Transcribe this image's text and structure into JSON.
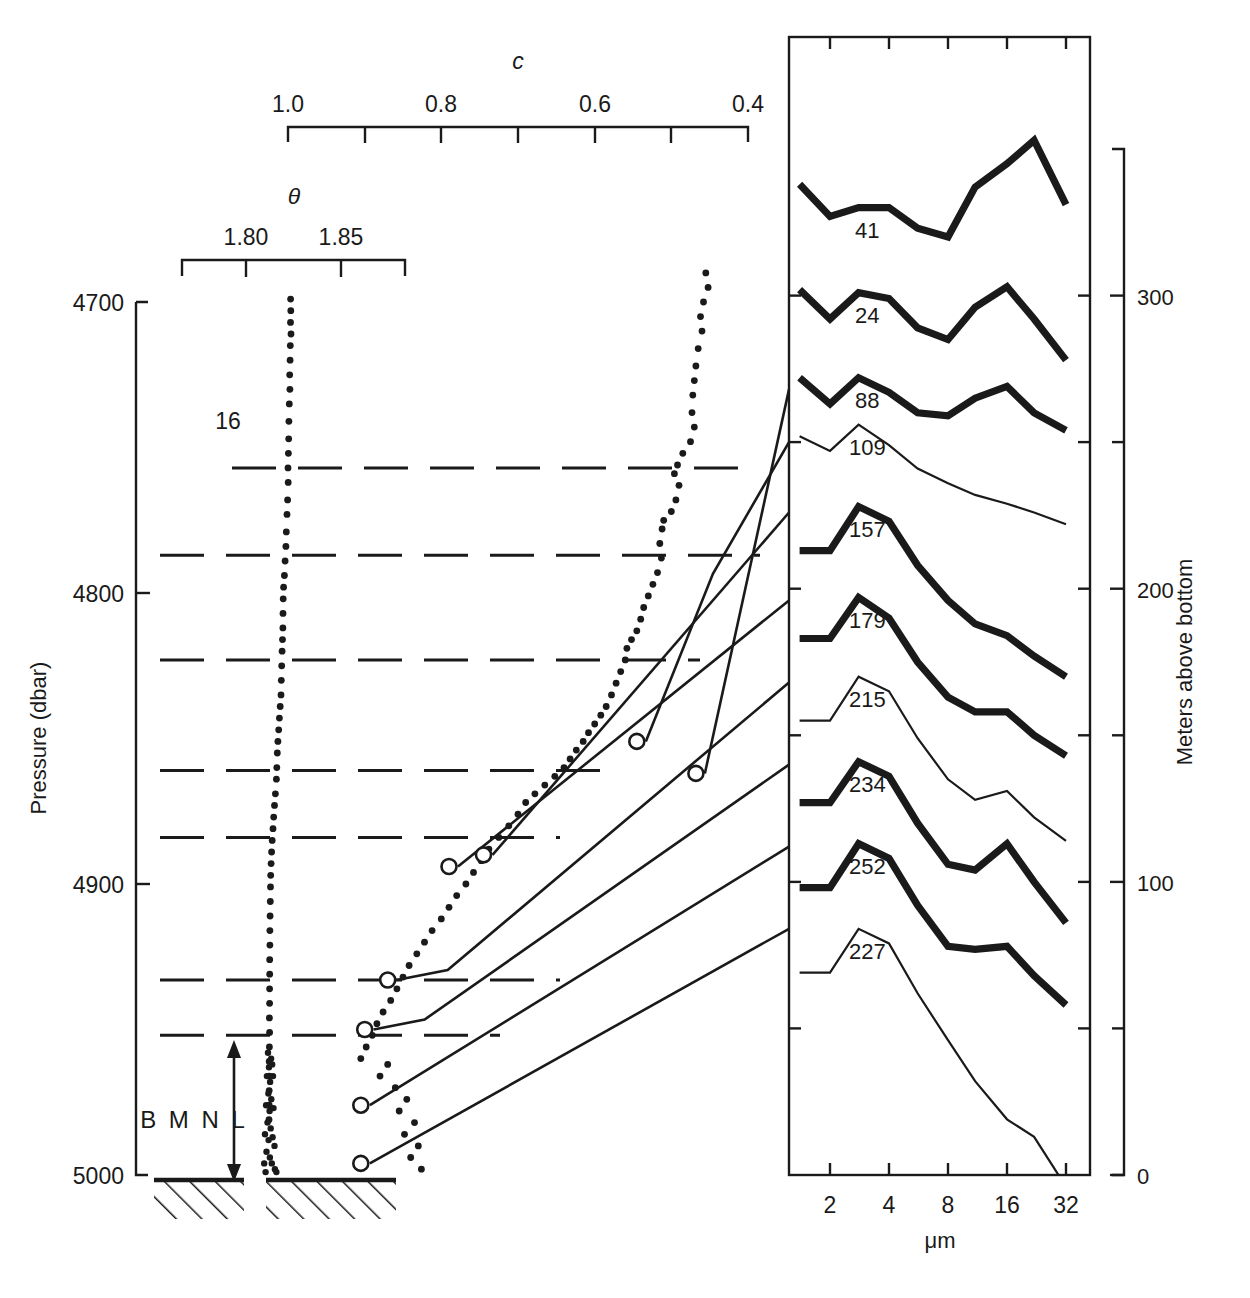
{
  "figure": {
    "type": "scientific-plot"
  },
  "left_axis": {
    "name": "Pressure (dbar)",
    "ticks": [
      "4700",
      "4800",
      "4900",
      "5000"
    ],
    "tick_values": [
      4700,
      4800,
      4900,
      5000
    ],
    "range": [
      4700,
      5000
    ]
  },
  "right_axis": {
    "name": "Meters above bottom",
    "ticks": [
      "300",
      "200",
      "100",
      "0"
    ],
    "tick_values": [
      300,
      200,
      100,
      0
    ],
    "minor_tick_values": [
      350,
      250,
      150,
      50
    ],
    "range": [
      0,
      350
    ]
  },
  "c_axis": {
    "title": "c",
    "ticks": [
      "1.0",
      "0.8",
      "0.6",
      "0.4"
    ],
    "tick_values": [
      1.0,
      0.8,
      0.6,
      0.4
    ],
    "minor_tick_values": [
      0.9,
      0.7,
      0.5
    ],
    "range": [
      1.0,
      0.4
    ]
  },
  "theta_axis": {
    "title": "θ",
    "ticks": [
      "1.80",
      "1.85"
    ],
    "tick_values": [
      1.8,
      1.85
    ],
    "range": [
      1.775,
      1.8625
    ]
  },
  "spectra_panel": {
    "x_axis_name": "μm",
    "x_ticks": [
      "2",
      "4",
      "8",
      "16",
      "32"
    ],
    "x_tick_values": [
      2,
      4,
      8,
      16,
      32
    ],
    "scale": "log2"
  },
  "annotations": {
    "bmnl": "B M N L",
    "interval_marker": "16"
  },
  "chart_data": {
    "type": "line",
    "title": "",
    "xlabel": "μm",
    "ylabel": "Meters above bottom",
    "grid": false,
    "legend": "inline-labels",
    "xlim": [
      1.4,
      32
    ],
    "ylim": [
      0,
      350
    ],
    "panels": [
      {
        "name": "theta-profile",
        "type": "scatter",
        "xlabel": "θ",
        "ylabel": "Pressure (dbar)",
        "xlim": [
          1.775,
          1.8625
        ],
        "ylim": [
          5000,
          4700
        ],
        "points": [
          [
            1.8235,
            4699
          ],
          [
            1.8236,
            4703
          ],
          [
            1.8234,
            4707
          ],
          [
            1.8237,
            4711
          ],
          [
            1.8233,
            4715
          ],
          [
            1.8232,
            4720
          ],
          [
            1.823,
            4725
          ],
          [
            1.8231,
            4730
          ],
          [
            1.8228,
            4735
          ],
          [
            1.8226,
            4741
          ],
          [
            1.8225,
            4747
          ],
          [
            1.8223,
            4752
          ],
          [
            1.8221,
            4757
          ],
          [
            1.8222,
            4762
          ],
          [
            1.8219,
            4768
          ],
          [
            1.8216,
            4773
          ],
          [
            1.8212,
            4779
          ],
          [
            1.821,
            4784
          ],
          [
            1.8206,
            4789
          ],
          [
            1.8202,
            4794
          ],
          [
            1.8198,
            4798
          ],
          [
            1.8196,
            4802
          ],
          [
            1.8195,
            4807
          ],
          [
            1.8194,
            4812
          ],
          [
            1.8192,
            4816
          ],
          [
            1.819,
            4820
          ],
          [
            1.8188,
            4825
          ],
          [
            1.8186,
            4830
          ],
          [
            1.8184,
            4835
          ],
          [
            1.818,
            4839
          ],
          [
            1.8176,
            4843
          ],
          [
            1.8172,
            4847
          ],
          [
            1.8168,
            4851
          ],
          [
            1.8165,
            4855
          ],
          [
            1.8162,
            4860
          ],
          [
            1.816,
            4864
          ],
          [
            1.8155,
            4869
          ],
          [
            1.815,
            4873
          ],
          [
            1.8146,
            4877
          ],
          [
            1.8142,
            4881
          ],
          [
            1.8138,
            4885
          ],
          [
            1.8135,
            4889
          ],
          [
            1.8132,
            4893
          ],
          [
            1.813,
            4897
          ],
          [
            1.8129,
            4901
          ],
          [
            1.8128,
            4906
          ],
          [
            1.8127,
            4911
          ],
          [
            1.8126,
            4916
          ],
          [
            1.8126,
            4921
          ],
          [
            1.8125,
            4926
          ],
          [
            1.8125,
            4931
          ],
          [
            1.8124,
            4936
          ],
          [
            1.8124,
            4941
          ],
          [
            1.8123,
            4946
          ],
          [
            1.8124,
            4951
          ],
          [
            1.8123,
            4956
          ],
          [
            1.8122,
            4961
          ],
          [
            1.8123,
            4966
          ],
          [
            1.8122,
            4971
          ],
          [
            1.8122,
            4976
          ],
          [
            1.8121,
            4981
          ]
        ]
      },
      {
        "name": "c-profile",
        "type": "scatter",
        "xlabel": "c",
        "xlim": [
          1.0,
          0.4
        ],
        "ylim": [
          5000,
          4700
        ],
        "points": [
          [
            0.455,
            4690
          ],
          [
            0.452,
            4695
          ],
          [
            0.458,
            4700
          ],
          [
            0.462,
            4705
          ],
          [
            0.46,
            4710
          ],
          [
            0.465,
            4716
          ],
          [
            0.468,
            4722
          ],
          [
            0.47,
            4727
          ],
          [
            0.472,
            4732
          ],
          [
            0.473,
            4738
          ],
          [
            0.47,
            4743
          ],
          [
            0.475,
            4748
          ],
          [
            0.485,
            4752
          ],
          [
            0.492,
            4756
          ],
          [
            0.496,
            4759
          ],
          [
            0.49,
            4763
          ],
          [
            0.494,
            4768
          ],
          [
            0.5,
            4772
          ],
          [
            0.51,
            4775
          ],
          [
            0.512,
            4778
          ],
          [
            0.515,
            4783
          ],
          [
            0.513,
            4788
          ],
          [
            0.518,
            4793
          ],
          [
            0.524,
            4797
          ],
          [
            0.53,
            4801
          ],
          [
            0.536,
            4805
          ],
          [
            0.54,
            4809
          ],
          [
            0.545,
            4813
          ],
          [
            0.552,
            4816
          ],
          [
            0.558,
            4819
          ],
          [
            0.56,
            4823
          ],
          [
            0.566,
            4827
          ],
          [
            0.572,
            4831
          ],
          [
            0.578,
            4835
          ],
          [
            0.585,
            4839
          ],
          [
            0.592,
            4842
          ],
          [
            0.6,
            4845
          ],
          [
            0.608,
            4848
          ],
          [
            0.615,
            4851
          ],
          [
            0.624,
            4854
          ],
          [
            0.632,
            4857
          ],
          [
            0.64,
            4860
          ],
          [
            0.652,
            4863
          ],
          [
            0.665,
            4866
          ],
          [
            0.678,
            4869
          ],
          [
            0.69,
            4872
          ],
          [
            0.7,
            4876
          ],
          [
            0.712,
            4880
          ],
          [
            0.725,
            4884
          ],
          [
            0.738,
            4888
          ],
          [
            0.748,
            4892
          ],
          [
            0.758,
            4896
          ],
          [
            0.768,
            4900
          ],
          [
            0.78,
            4904
          ],
          [
            0.79,
            4908
          ],
          [
            0.8,
            4912
          ],
          [
            0.812,
            4916
          ],
          [
            0.822,
            4920
          ],
          [
            0.832,
            4924
          ],
          [
            0.842,
            4928
          ],
          [
            0.85,
            4932
          ],
          [
            0.858,
            4936
          ],
          [
            0.866,
            4940
          ],
          [
            0.876,
            4944
          ],
          [
            0.884,
            4948
          ],
          [
            0.89,
            4952
          ],
          [
            0.898,
            4956
          ],
          [
            0.905,
            4960
          ],
          [
            0.87,
            4962
          ],
          [
            0.88,
            4966
          ],
          [
            0.86,
            4970
          ],
          [
            0.845,
            4974
          ],
          [
            0.855,
            4978
          ],
          [
            0.835,
            4982
          ],
          [
            0.848,
            4986
          ],
          [
            0.83,
            4990
          ],
          [
            0.84,
            4994
          ],
          [
            0.826,
            4998
          ]
        ]
      }
    ],
    "spectra": [
      {
        "label": "41",
        "weight": "thick",
        "mab": 330,
        "x": [
          1.4,
          2,
          2.8,
          4,
          5.6,
          8,
          11,
          16,
          22,
          32
        ],
        "y": [
          338,
          327,
          330,
          330,
          323,
          320,
          337,
          345,
          353,
          331
        ]
      },
      {
        "label": "24",
        "weight": "thick",
        "mab": 300,
        "x": [
          1.4,
          2,
          2.8,
          4,
          5.6,
          8,
          11,
          16,
          22,
          32
        ],
        "y": [
          302,
          292,
          301,
          299,
          289,
          285,
          296,
          303,
          292,
          278
        ]
      },
      {
        "label": "88",
        "weight": "thick",
        "mab": 268,
        "x": [
          1.4,
          2,
          2.8,
          4,
          5.6,
          8,
          11,
          16,
          22,
          32
        ],
        "y": [
          272,
          263,
          272,
          267,
          260,
          259,
          265,
          269,
          260,
          254
        ]
      },
      {
        "label": "109",
        "weight": "thin",
        "mab": 250,
        "x": [
          1.4,
          2,
          2.8,
          4,
          5.6,
          8,
          11,
          16,
          22,
          32
        ],
        "y": [
          252,
          247,
          256,
          249,
          241,
          236,
          232,
          229,
          226,
          222
        ]
      },
      {
        "label": "157",
        "weight": "thick",
        "mab": 226,
        "x": [
          1.4,
          2,
          2.8,
          4,
          5.6,
          8,
          11,
          16,
          22,
          32
        ],
        "y": [
          213,
          213,
          228,
          223,
          208,
          196,
          188,
          184,
          177,
          170
        ]
      },
      {
        "label": "179",
        "weight": "thick",
        "mab": 196,
        "x": [
          1.4,
          2,
          2.8,
          4,
          5.6,
          8,
          11,
          16,
          22,
          32
        ],
        "y": [
          183,
          183,
          197,
          190,
          175,
          163,
          158,
          158,
          150,
          143
        ]
      },
      {
        "label": "215",
        "weight": "thin",
        "mab": 168,
        "x": [
          1.4,
          2,
          2.8,
          4,
          5.6,
          8,
          11,
          16,
          22,
          32
        ],
        "y": [
          155,
          155,
          170,
          165,
          149,
          135,
          128,
          131,
          122,
          114
        ]
      },
      {
        "label": "234",
        "weight": "thick",
        "mab": 140,
        "x": [
          1.4,
          2,
          2.8,
          4,
          5.6,
          8,
          11,
          16,
          22,
          32
        ],
        "y": [
          127,
          127,
          141,
          136,
          120,
          106,
          104,
          113,
          100,
          86
        ]
      },
      {
        "label": "252",
        "weight": "thick",
        "mab": 112,
        "x": [
          1.4,
          2,
          2.8,
          4,
          5.6,
          8,
          11,
          16,
          22,
          32
        ],
        "y": [
          98,
          98,
          113,
          108,
          92,
          78,
          77,
          78,
          68,
          58
        ]
      },
      {
        "label": "227",
        "weight": "thin",
        "mab": 84,
        "x": [
          1.4,
          2,
          2.8,
          4,
          5.6,
          8,
          11,
          16,
          22,
          32
        ],
        "y": [
          69,
          69,
          84,
          79,
          62,
          46,
          32,
          19,
          13,
          -4
        ]
      }
    ],
    "sample_markers": [
      {
        "label": "88",
        "c": 0.468,
        "pressure": 4862,
        "mab": 268
      },
      {
        "label": "109",
        "c": 0.545,
        "pressure": 4851,
        "mab": 250
      },
      {
        "label": "157",
        "c": 0.745,
        "pressure": 4890,
        "mab": 226
      },
      {
        "label": "179",
        "c": 0.79,
        "pressure": 4894,
        "mab": 196
      },
      {
        "label": "215",
        "c": 0.87,
        "pressure": 4933,
        "mab": 168
      },
      {
        "label": "234",
        "c": 0.9,
        "pressure": 4950,
        "mab": 140
      },
      {
        "label": "252",
        "c": 0.905,
        "pressure": 4976,
        "mab": 112
      },
      {
        "label": "227",
        "c": 0.905,
        "pressure": 4996,
        "mab": 84
      }
    ],
    "interval_lines_pressure": [
      4861,
      4884,
      4757,
      4787,
      4844,
      4875,
      4861,
      4933,
      4952
    ]
  }
}
